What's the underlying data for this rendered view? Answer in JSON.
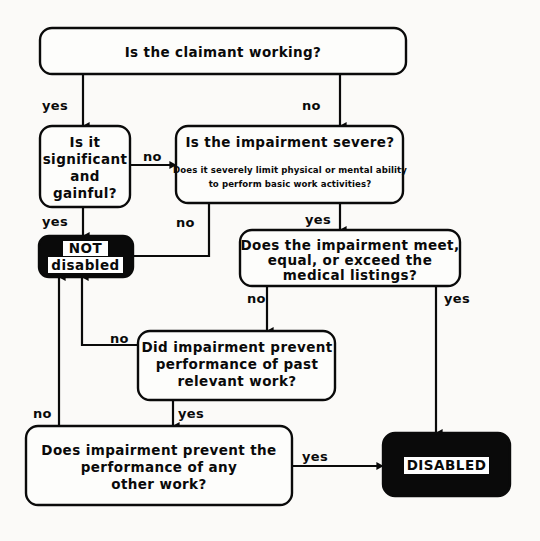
{
  "diagram": {
    "background_color": "#fbfaf8",
    "ink_color": "#0a0a0a",
    "terminal_fill": "#0a0a0a",
    "terminal_text_color": "#0a0a0a",
    "terminal_plate_color": "#ffffff"
  },
  "nodes": {
    "claimant_working": {
      "shape": "rounded-rect",
      "line1": "Is the claimant working?"
    },
    "significant_gainful": {
      "shape": "rounded-rect",
      "line1": "Is it",
      "line2": "significant",
      "line3": "and",
      "line4": "gainful?"
    },
    "impairment_severe": {
      "shape": "rounded-rect",
      "line1": "Is the impairment severe?",
      "sub1": "Does it severely limit physical or mental ability",
      "sub2": "to perform basic work activities?"
    },
    "medical_listings": {
      "shape": "rounded-rect",
      "line1": "Does the impairment meet,",
      "line2": "equal, or exceed the",
      "line3": "medical listings?"
    },
    "past_relevant_work": {
      "shape": "rounded-rect",
      "line1": "Did impairment prevent",
      "line2": "performance of past",
      "line3": "relevant work?"
    },
    "other_work": {
      "shape": "rounded-rect",
      "line1": "Does impairment prevent the",
      "line2": "performance of any",
      "line3": "other work?"
    },
    "not_disabled": {
      "shape": "rounded-rect-filled",
      "line1": "NOT",
      "line2": "disabled"
    },
    "disabled": {
      "shape": "rounded-rect-filled",
      "line1": "DISABLED"
    }
  },
  "edges": [
    {
      "id": "working-yes",
      "from": "claimant_working",
      "to": "significant_gainful",
      "label": "yes"
    },
    {
      "id": "working-no",
      "from": "claimant_working",
      "to": "impairment_severe",
      "label": "no"
    },
    {
      "id": "gainful-no",
      "from": "significant_gainful",
      "to": "impairment_severe",
      "label": "no"
    },
    {
      "id": "gainful-yes",
      "from": "significant_gainful",
      "to": "not_disabled",
      "label": "yes"
    },
    {
      "id": "severe-no",
      "from": "impairment_severe",
      "to": "not_disabled",
      "label": "no"
    },
    {
      "id": "severe-yes",
      "from": "impairment_severe",
      "to": "medical_listings",
      "label": "yes"
    },
    {
      "id": "listings-no",
      "from": "medical_listings",
      "to": "past_relevant_work",
      "label": "no"
    },
    {
      "id": "listings-yes",
      "from": "medical_listings",
      "to": "disabled",
      "label": "yes"
    },
    {
      "id": "past-work-no",
      "from": "past_relevant_work",
      "to": "not_disabled",
      "label": "no"
    },
    {
      "id": "past-work-yes",
      "from": "past_relevant_work",
      "to": "other_work",
      "label": "yes"
    },
    {
      "id": "other-work-no",
      "from": "other_work",
      "to": "not_disabled",
      "label": "no"
    },
    {
      "id": "other-work-yes",
      "from": "other_work",
      "to": "disabled",
      "label": "yes"
    }
  ],
  "edge_labels": {
    "working_yes": "yes",
    "working_no": "no",
    "gainful_no": "no",
    "gainful_yes": "yes",
    "severe_no": "no",
    "severe_yes": "yes",
    "listings_no": "no",
    "listings_yes": "yes",
    "past_work_no": "no",
    "past_work_yes": "yes",
    "other_work_no": "no",
    "other_work_yes": "yes"
  }
}
